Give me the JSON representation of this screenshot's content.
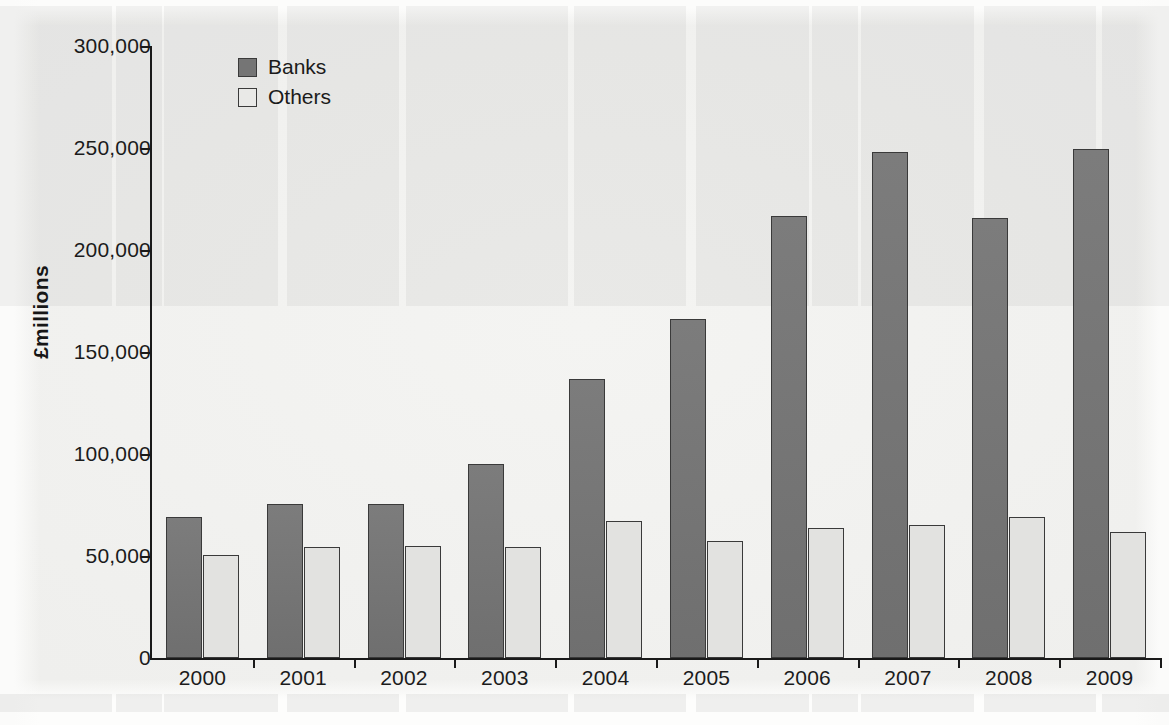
{
  "chart_data": {
    "type": "bar",
    "title": "",
    "subtitle": "",
    "xlabel": "",
    "ylabel": "£millions",
    "categories": [
      "2000",
      "2001",
      "2002",
      "2003",
      "2004",
      "2005",
      "2006",
      "2007",
      "2008",
      "2009"
    ],
    "series": [
      {
        "name": "Banks",
        "color": "#757575",
        "values": [
          69000,
          75500,
          75500,
          95000,
          137000,
          166000,
          216500,
          248000,
          215500,
          249500
        ]
      },
      {
        "name": "Others",
        "color": "#e2e2e0",
        "values": [
          50500,
          54500,
          55000,
          54500,
          67000,
          57500,
          63500,
          65000,
          69000,
          62000
        ]
      }
    ],
    "ylim": [
      0,
      300000
    ],
    "ytick_values": [
      0,
      50000,
      100000,
      150000,
      200000,
      250000,
      300000
    ],
    "ytick_labels": [
      "0",
      "50,000",
      "100,000",
      "150,000",
      "200,000",
      "250,000",
      "300,000"
    ],
    "grid": false,
    "legend_position": "top-left",
    "annotations": []
  },
  "legend": {
    "items": [
      {
        "label": "Banks",
        "swatch": "dark-gray-swatch"
      },
      {
        "label": "Others",
        "swatch": "light-gray-swatch"
      }
    ]
  }
}
